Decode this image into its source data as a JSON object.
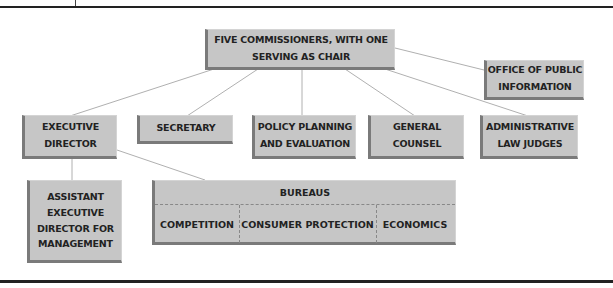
{
  "chart": {
    "top": {
      "line1": "FIVE COMMISSIONERS, WITH ONE",
      "line2": "SERVING AS CHAIR"
    },
    "office_public_info": {
      "line1": "OFFICE OF PUBLIC",
      "line2": "INFORMATION"
    },
    "executive_director": {
      "line1": "EXECUTIVE",
      "line2": "DIRECTOR"
    },
    "secretary": {
      "line1": "SECRETARY"
    },
    "policy_planning": {
      "line1": "POLICY PLANNING",
      "line2": "AND EVALUATION"
    },
    "general_counsel": {
      "line1": "GENERAL",
      "line2": "COUNSEL"
    },
    "admin_law_judges": {
      "line1": "ADMINISTRATIVE",
      "line2": "LAW JUDGES"
    },
    "assistant_ed": {
      "line1": "ASSISTANT",
      "line2": "EXECUTIVE",
      "line3": "DIRECTOR FOR",
      "line4": "MANAGEMENT"
    },
    "bureaus": {
      "title": "BUREAUS",
      "items": [
        "COMPETITION",
        "CONSUMER PROTECTION",
        "ECONOMICS"
      ]
    }
  },
  "colors": {
    "box_fill": "#c6c6c6",
    "box_shadow": "#7a7a7a",
    "line": "#b0b0b0",
    "rule": "#222222"
  }
}
